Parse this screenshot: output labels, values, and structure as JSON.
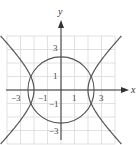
{
  "diagram": {
    "type": "coordinate-graph",
    "axes": {
      "x_label": "x",
      "y_label": "y"
    },
    "x_ticks": [
      {
        "value": -3,
        "label": "−3"
      },
      {
        "value": -1,
        "label": "−1"
      },
      {
        "value": 1,
        "label": "1"
      },
      {
        "value": 3,
        "label": "3"
      }
    ],
    "y_ticks": [
      {
        "value": 3,
        "label": "3"
      },
      {
        "value": 1,
        "label": "1"
      },
      {
        "value": -1,
        "label": "−1"
      },
      {
        "value": -3,
        "label": "−3"
      }
    ],
    "grid": {
      "xmin": -4,
      "xmax": 4,
      "ymin": -4,
      "ymax": 4,
      "step": 1
    },
    "curves": [
      {
        "name": "circle",
        "equation": "x^2 + y^2 = 6",
        "color": "#555555"
      },
      {
        "name": "hyperbola",
        "equation": "x^2 - y^2 = 4",
        "color": "#555555"
      }
    ],
    "colors": {
      "grid": "#d9d9d9",
      "axis": "#333333",
      "curve": "#555555"
    }
  }
}
